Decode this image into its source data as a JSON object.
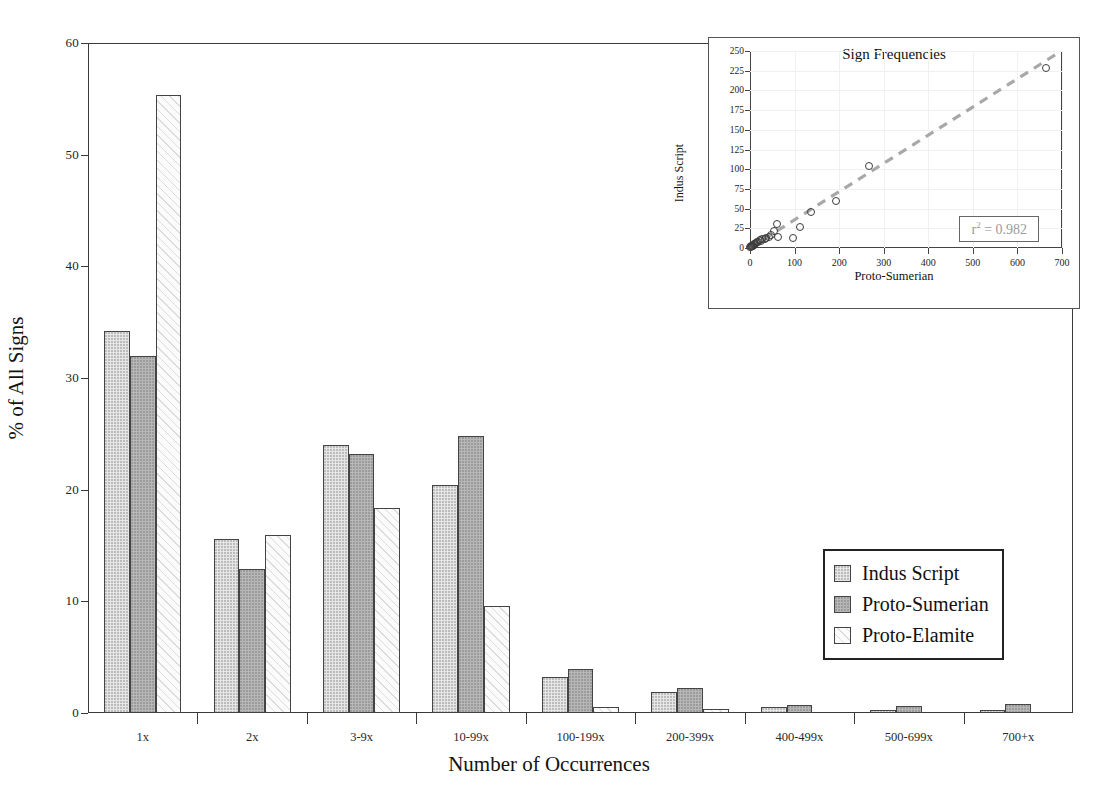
{
  "chart_data": [
    {
      "type": "bar",
      "title": "",
      "xlabel": "Number of Occurrences",
      "ylabel": "% of All Signs",
      "ylim": [
        0,
        60
      ],
      "yticks": [
        0,
        10,
        20,
        30,
        40,
        50,
        60
      ],
      "grid": false,
      "legend_position": "inside-right",
      "categories": [
        "1x",
        "2x",
        "3-9x",
        "10-99x",
        "100-199x",
        "200-399x",
        "400-499x",
        "500-699x",
        "700+x"
      ],
      "series": [
        {
          "name": "Indus Script",
          "color": "#e6e6e6",
          "values": [
            34.2,
            15.6,
            24.0,
            20.4,
            3.2,
            1.9,
            0.5,
            0.3,
            0.3
          ]
        },
        {
          "name": "Proto-Sumerian",
          "color": "#b7b7b7",
          "values": [
            32.0,
            12.9,
            23.2,
            24.8,
            3.9,
            2.2,
            0.7,
            0.6,
            0.8
          ]
        },
        {
          "name": "Proto-Elamite",
          "color": "#fbfbfb",
          "values": [
            55.3,
            15.9,
            18.4,
            9.6,
            0.5,
            0.4,
            0.0,
            0.0,
            0.0
          ]
        }
      ]
    },
    {
      "type": "scatter",
      "title": "Sign Frequencies",
      "xlabel": "Proto-Sumerian",
      "ylabel": "Indus Script",
      "xlim": [
        0,
        700
      ],
      "ylim": [
        0,
        250
      ],
      "xticks": [
        0,
        100,
        200,
        300,
        400,
        500,
        600,
        700
      ],
      "yticks": [
        0,
        25,
        50,
        75,
        100,
        125,
        150,
        175,
        200,
        225,
        250
      ],
      "grid": true,
      "annotation": "r² = 0.982",
      "annotation_value": 0.982,
      "trendline": {
        "style": "dashed",
        "color": "#a8a8a8",
        "x0": 0,
        "y0": 0,
        "x1": 690,
        "y1": 247
      },
      "points": [
        {
          "x": 665,
          "y": 229
        },
        {
          "x": 268,
          "y": 104
        },
        {
          "x": 194,
          "y": 60
        },
        {
          "x": 136,
          "y": 46
        },
        {
          "x": 113,
          "y": 27
        },
        {
          "x": 96,
          "y": 13
        },
        {
          "x": 60,
          "y": 30
        },
        {
          "x": 53,
          "y": 22
        },
        {
          "x": 62,
          "y": 14
        },
        {
          "x": 48,
          "y": 16
        },
        {
          "x": 42,
          "y": 14
        },
        {
          "x": 36,
          "y": 13
        },
        {
          "x": 33,
          "y": 11
        },
        {
          "x": 28,
          "y": 12
        },
        {
          "x": 25,
          "y": 9
        },
        {
          "x": 22,
          "y": 10
        },
        {
          "x": 19,
          "y": 8
        },
        {
          "x": 16,
          "y": 7
        },
        {
          "x": 14,
          "y": 6
        },
        {
          "x": 12,
          "y": 5
        },
        {
          "x": 10,
          "y": 5
        },
        {
          "x": 8,
          "y": 4
        },
        {
          "x": 7,
          "y": 3
        },
        {
          "x": 5,
          "y": 3
        },
        {
          "x": 4,
          "y": 2
        },
        {
          "x": 3,
          "y": 2
        },
        {
          "x": 2,
          "y": 1
        },
        {
          "x": 1,
          "y": 1
        }
      ]
    }
  ],
  "legend": {
    "items": [
      {
        "label": "Indus Script"
      },
      {
        "label": "Proto-Sumerian"
      },
      {
        "label": "Proto-Elamite"
      }
    ]
  }
}
